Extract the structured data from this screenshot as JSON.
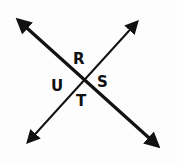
{
  "diagram": {
    "type": "intersecting-lines",
    "lines": [
      {
        "name": "line-1",
        "from": [
          14,
          16
        ],
        "to": [
          162,
          150
        ],
        "arrows": "both",
        "weight": "thick"
      },
      {
        "name": "line-2",
        "from": [
          141,
          18
        ],
        "to": [
          24,
          146
        ],
        "arrows": "both",
        "weight": "thin"
      }
    ],
    "intersection": [
      82,
      80
    ],
    "angle_labels": [
      {
        "text": "R",
        "x": 76,
        "y": 66
      },
      {
        "text": "S",
        "x": 99,
        "y": 86
      },
      {
        "text": "T",
        "x": 78,
        "y": 106
      },
      {
        "text": "U",
        "x": 51,
        "y": 90
      }
    ],
    "colors": {
      "stroke": "#111111",
      "background": "#fdfdfd"
    }
  }
}
